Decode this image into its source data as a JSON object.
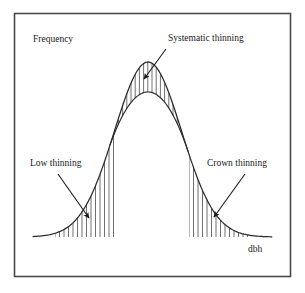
{
  "figure": {
    "frame_color": "#4a4a4a",
    "background": "#ffffff",
    "ink_color": "#1a1a1a",
    "curve_color": "#2b2b2b",
    "hatch_color": "#555555"
  },
  "labels": {
    "y_axis": "Frequency",
    "x_axis": "dbh",
    "systematic": "Systematic thinning",
    "low": "Low thinning",
    "crown": "Crown thinning"
  },
  "chart_data": {
    "type": "area",
    "title": "",
    "xlabel": "dbh",
    "ylabel": "Frequency",
    "grid": false,
    "legend": "none",
    "axis_lines_drawn": false,
    "baseline_y": 237,
    "distribution": {
      "shape": "normal",
      "peak_x": 148,
      "peak_y": 62,
      "left_tail_x": 33,
      "right_tail_x": 272
    },
    "annotations": [
      {
        "name": "systematic",
        "label": "Systematic thinning",
        "label_x": 168,
        "label_y": 41,
        "arrow_from_x": 166,
        "arrow_from_y": 49,
        "arrow_to_x": 144,
        "arrow_to_y": 79,
        "region": "central-crescent"
      },
      {
        "name": "low",
        "label": "Low thinning",
        "label_x": 30,
        "label_y": 166,
        "arrow_from_x": 58,
        "arrow_from_y": 174,
        "arrow_to_x": 89,
        "arrow_to_y": 218,
        "region": "left-tail"
      },
      {
        "name": "crown",
        "label": "Crown thinning",
        "label_x": 207,
        "label_y": 166,
        "arrow_from_x": 245,
        "arrow_from_y": 174,
        "arrow_to_x": 214,
        "arrow_to_y": 217,
        "region": "right-tail"
      }
    ],
    "hatched_regions": [
      {
        "name": "low-thinning",
        "label": "Low thinning",
        "x_start": 55,
        "x_end": 115,
        "line_spacing": 4.5,
        "bounded_above": "curve",
        "bounded_below": "baseline"
      },
      {
        "name": "systematic-thinning",
        "label": "Systematic thinning",
        "x_start": 112,
        "x_end": 185,
        "line_spacing": 4.2,
        "bounded_above": "curve-peak",
        "bounded_below": "inner-arc"
      },
      {
        "name": "crown-thinning",
        "label": "Crown thinning",
        "x_start": 189,
        "x_end": 248,
        "line_spacing": 4.5,
        "bounded_above": "curve",
        "bounded_below": "baseline"
      }
    ]
  }
}
